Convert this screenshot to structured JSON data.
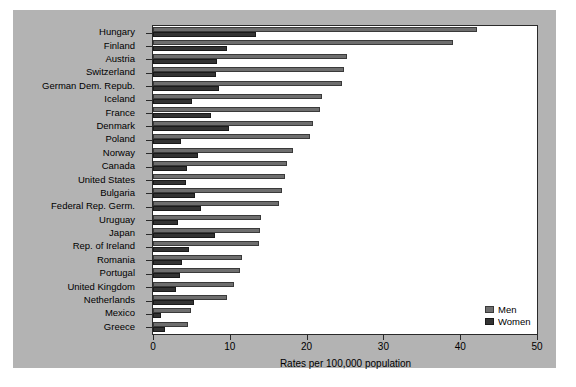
{
  "chart_data": {
    "type": "bar",
    "orientation": "horizontal",
    "title": "",
    "xlabel": "Rates per 100,000 population",
    "ylabel": "",
    "xlim": [
      0,
      50
    ],
    "xticks": [
      0,
      10,
      20,
      30,
      40,
      50
    ],
    "xticklabels": [
      "0",
      "10",
      "20",
      "30",
      "40",
      "50"
    ],
    "grid": false,
    "legend_position": "bottom-right",
    "categories": [
      "Hungary",
      "Finland",
      "Austria",
      "Switzerland",
      "German Dem. Repub.",
      "Iceland",
      "France",
      "Denmark",
      "Poland",
      "Norway",
      "Canada",
      "United States",
      "Bulgaria",
      "Federal Rep. Germ.",
      "Uruguay",
      "Japan",
      "Rep. of Ireland",
      "Romania",
      "Portugal",
      "United Kingdom",
      "Netherlands",
      "Mexico",
      "Greece"
    ],
    "series": [
      {
        "name": "Men",
        "color": "#6e6e6e",
        "values": [
          42.2,
          39.0,
          25.2,
          24.9,
          24.6,
          22.0,
          21.8,
          20.8,
          20.4,
          18.2,
          17.5,
          17.2,
          16.8,
          16.4,
          14.0,
          13.9,
          13.8,
          11.6,
          11.3,
          10.5,
          9.6,
          4.9,
          4.6
        ]
      },
      {
        "name": "Women",
        "color": "#333333",
        "values": [
          13.4,
          9.7,
          8.3,
          8.2,
          8.6,
          5.1,
          7.6,
          9.9,
          3.6,
          5.9,
          4.4,
          4.3,
          5.5,
          6.3,
          3.3,
          8.1,
          4.7,
          3.8,
          3.5,
          3.0,
          5.3,
          1.1,
          1.6
        ]
      }
    ],
    "legend": [
      "Men",
      "Women"
    ]
  }
}
